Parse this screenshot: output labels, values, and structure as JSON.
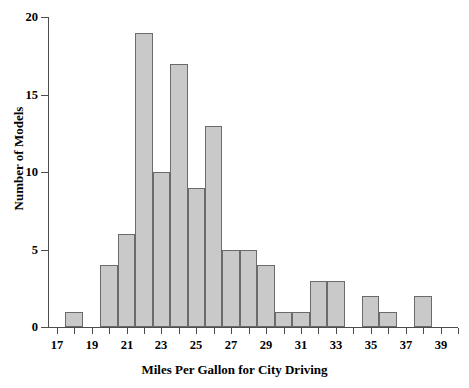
{
  "chart_data": {
    "type": "bar",
    "title": "",
    "subtitle": "",
    "xlabel": "Miles Per Gallon for City Driving",
    "ylabel": "Number of Models",
    "xlim": [
      16.5,
      40.0
    ],
    "ylim": [
      0,
      20
    ],
    "grid": false,
    "legend": null,
    "bin_width": 1,
    "x_tick_labels": [
      "17",
      "19",
      "21",
      "23",
      "25",
      "27",
      "29",
      "31",
      "33",
      "35",
      "37",
      "39"
    ],
    "x_tick_values": [
      17,
      19,
      21,
      23,
      25,
      27,
      29,
      31,
      33,
      35,
      37,
      39
    ],
    "x_minor_tick_values": [
      18,
      20,
      22,
      24,
      26,
      28,
      30,
      32,
      34,
      36,
      38,
      40
    ],
    "y_tick_labels": [
      "0",
      "5",
      "10",
      "15",
      "20"
    ],
    "y_tick_values": [
      0,
      5,
      10,
      15,
      20
    ],
    "categories": [
      18,
      19,
      20,
      21,
      22,
      23,
      24,
      25,
      26,
      27,
      28,
      29,
      30,
      31,
      32,
      33,
      34,
      35,
      36,
      37,
      38
    ],
    "values": [
      1,
      0,
      4,
      6,
      19,
      10,
      17,
      9,
      13,
      5,
      5,
      4,
      1,
      1,
      3,
      3,
      0,
      2,
      1,
      0,
      2
    ],
    "bins": [
      {
        "center": 18,
        "start": 17.5,
        "end": 18.5,
        "count": 1
      },
      {
        "center": 19,
        "start": 18.5,
        "end": 19.5,
        "count": 0
      },
      {
        "center": 20,
        "start": 19.5,
        "end": 20.5,
        "count": 4
      },
      {
        "center": 21,
        "start": 20.5,
        "end": 21.5,
        "count": 6
      },
      {
        "center": 22,
        "start": 21.5,
        "end": 22.5,
        "count": 19
      },
      {
        "center": 23,
        "start": 22.5,
        "end": 23.5,
        "count": 10
      },
      {
        "center": 24,
        "start": 23.5,
        "end": 24.5,
        "count": 17
      },
      {
        "center": 25,
        "start": 24.5,
        "end": 25.5,
        "count": 9
      },
      {
        "center": 26,
        "start": 25.5,
        "end": 26.5,
        "count": 13
      },
      {
        "center": 27,
        "start": 26.5,
        "end": 27.5,
        "count": 5
      },
      {
        "center": 28,
        "start": 27.5,
        "end": 28.5,
        "count": 5
      },
      {
        "center": 29,
        "start": 28.5,
        "end": 29.5,
        "count": 4
      },
      {
        "center": 30,
        "start": 29.5,
        "end": 30.5,
        "count": 1
      },
      {
        "center": 31,
        "start": 30.5,
        "end": 31.5,
        "count": 1
      },
      {
        "center": 32,
        "start": 31.5,
        "end": 32.5,
        "count": 3
      },
      {
        "center": 33,
        "start": 32.5,
        "end": 33.5,
        "count": 3
      },
      {
        "center": 34,
        "start": 33.5,
        "end": 34.5,
        "count": 0
      },
      {
        "center": 35,
        "start": 34.5,
        "end": 35.5,
        "count": 2
      },
      {
        "center": 36,
        "start": 35.5,
        "end": 36.5,
        "count": 1
      },
      {
        "center": 37,
        "start": 36.5,
        "end": 37.5,
        "count": 0
      },
      {
        "center": 38,
        "start": 37.5,
        "end": 38.5,
        "count": 2
      }
    ],
    "colors": {
      "bar_fill": "#c9c9c9",
      "bar_stroke": "#6b6b6b",
      "axis": "#4c4c4c",
      "text": "#000000",
      "background": "#ffffff"
    }
  }
}
